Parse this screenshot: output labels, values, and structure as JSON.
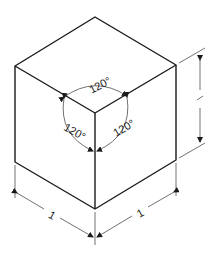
{
  "diagram": {
    "angles": [
      {
        "id": "top",
        "label": "120°"
      },
      {
        "id": "left",
        "label": "120°"
      },
      {
        "id": "right",
        "label": "120°"
      }
    ],
    "dimensions": [
      {
        "id": "height",
        "label": "1"
      },
      {
        "id": "left-width",
        "label": "1"
      },
      {
        "id": "right-width",
        "label": "1"
      }
    ],
    "colors": {
      "line": "#1a1a1a",
      "background": "#ffffff"
    }
  }
}
